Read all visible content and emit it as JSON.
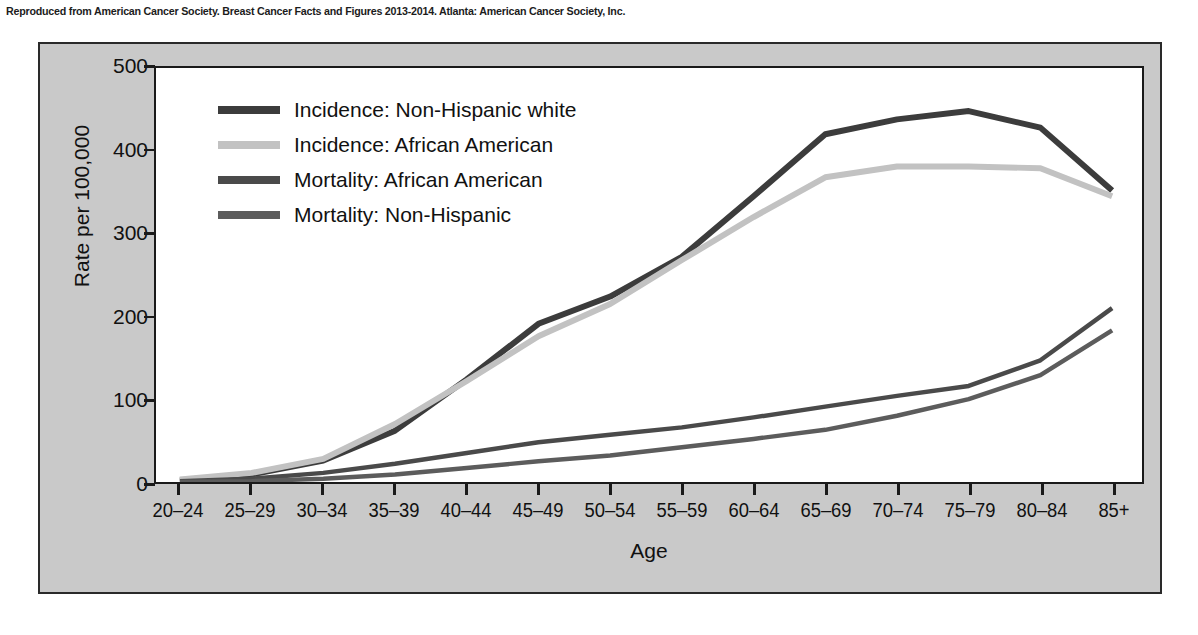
{
  "caption": "Reproduced from American Cancer Society. Breast Cancer Facts and Figures 2013-2014. Atlanta: American Cancer Society, Inc.",
  "chart_data": {
    "type": "line",
    "title": "",
    "xlabel": "Age",
    "ylabel": "Rate per 100,000",
    "categories": [
      "20–24",
      "25–29",
      "30–34",
      "35–39",
      "40–44",
      "45–49",
      "50–54",
      "55–59",
      "60–64",
      "65–69",
      "70–74",
      "75–79",
      "80–84",
      "85+"
    ],
    "ylim": [
      0,
      500
    ],
    "yticks": [
      0,
      100,
      200,
      300,
      400,
      500
    ],
    "ytick_labels": [
      "0",
      "100",
      "200",
      "300",
      "400",
      "500"
    ],
    "grid": false,
    "legend_position": "upper-left-inside",
    "series": [
      {
        "name": "Incidence: Non-Hispanic white",
        "color": "#3c3c3c",
        "width": 6,
        "values": [
          2,
          9,
          26,
          62,
          124,
          191,
          224,
          272,
          345,
          420,
          438,
          448,
          428,
          352
        ]
      },
      {
        "name": "Incidence: African American",
        "color": "#c2c2c2",
        "width": 6,
        "values": [
          3,
          11,
          28,
          70,
          122,
          176,
          215,
          268,
          320,
          368,
          381,
          381,
          379,
          345
        ]
      },
      {
        "name": "Mortality: African American",
        "color": "#4a4a4a",
        "width": 4.5,
        "values": [
          1,
          4,
          11,
          22,
          35,
          48,
          57,
          66,
          78,
          91,
          104,
          116,
          147,
          210
        ]
      },
      {
        "name": "Mortality: Non-Hispanic",
        "color": "#5c5c5c",
        "width": 4.5,
        "values": [
          0,
          1,
          4,
          9,
          17,
          25,
          32,
          42,
          52,
          63,
          80,
          100,
          129,
          183
        ]
      }
    ]
  }
}
